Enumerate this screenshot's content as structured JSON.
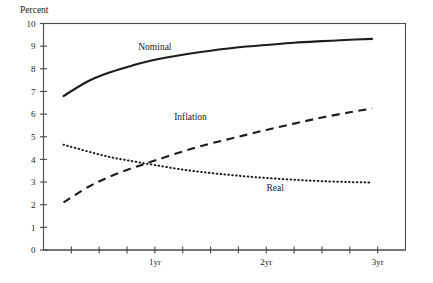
{
  "chart_data": {
    "type": "line",
    "title": "",
    "ylabel": "Percent",
    "xlabel": "",
    "ylim": [
      0,
      10
    ],
    "xlim": [
      0,
      3.25
    ],
    "grid": false,
    "legend_position": "inline-annotations",
    "y_ticks": [
      "0",
      "1",
      "2",
      "3",
      "4",
      "5",
      "6",
      "7",
      "8",
      "9",
      "10"
    ],
    "y_tick_values": [
      0,
      1,
      2,
      3,
      4,
      5,
      6,
      7,
      8,
      9,
      10
    ],
    "x_tick_values": [
      0.25,
      0.5,
      0.75,
      1.0,
      1.25,
      1.5,
      1.75,
      2.0,
      2.25,
      2.5,
      2.75,
      3.0
    ],
    "x_tick_labels": [
      "",
      "",
      "",
      "1yr",
      "",
      "",
      "",
      "2yr",
      "",
      "",
      "",
      "3yr"
    ],
    "x_labeled_ticks": [
      {
        "value": 1.0,
        "label": "1yr"
      },
      {
        "value": 2.0,
        "label": "2yr"
      },
      {
        "value": 3.0,
        "label": "3yr"
      }
    ],
    "series": [
      {
        "name": "Nominal",
        "style": "solid",
        "label_x": 1.0,
        "label_y": 8.85,
        "x": [
          0.18,
          0.4,
          0.6,
          0.8,
          1.0,
          1.25,
          1.5,
          1.75,
          2.0,
          2.25,
          2.5,
          2.75,
          2.95
        ],
        "values": [
          6.8,
          7.45,
          7.85,
          8.15,
          8.4,
          8.62,
          8.8,
          8.95,
          9.05,
          9.15,
          9.22,
          9.28,
          9.32
        ]
      },
      {
        "name": "Inflation",
        "style": "dashed",
        "label_x": 1.32,
        "label_y": 5.75,
        "x": [
          0.18,
          0.4,
          0.6,
          0.8,
          1.0,
          1.25,
          1.5,
          1.75,
          2.0,
          2.25,
          2.5,
          2.75,
          2.95
        ],
        "values": [
          2.1,
          2.78,
          3.25,
          3.62,
          3.95,
          4.35,
          4.7,
          5.0,
          5.3,
          5.58,
          5.85,
          6.08,
          6.25
        ]
      },
      {
        "name": "Real",
        "style": "dotted",
        "label_x": 2.08,
        "label_y": 2.62,
        "x": [
          0.18,
          0.4,
          0.6,
          0.8,
          1.0,
          1.25,
          1.5,
          1.75,
          2.0,
          2.25,
          2.5,
          2.75,
          2.95
        ],
        "values": [
          4.65,
          4.35,
          4.1,
          3.92,
          3.75,
          3.55,
          3.4,
          3.28,
          3.18,
          3.1,
          3.04,
          3.0,
          2.98
        ]
      }
    ],
    "colors": {
      "line": "#1c1c1c",
      "axis": "#4a4a4a",
      "text": "#1a1a1a",
      "background": "#ffffff"
    }
  }
}
